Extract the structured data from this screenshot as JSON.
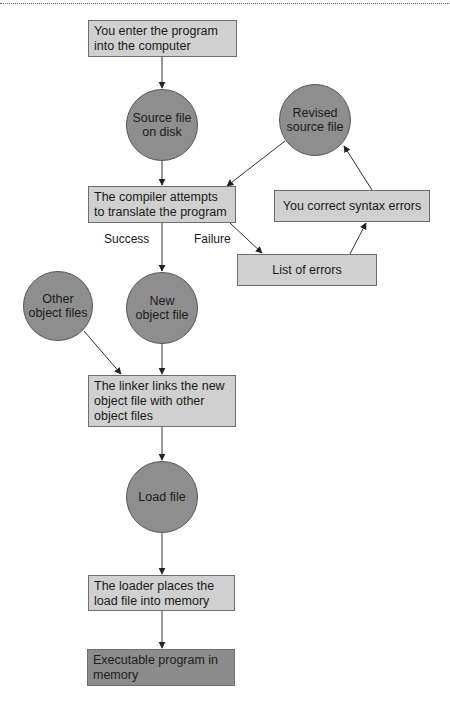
{
  "diagram": {
    "type": "flowchart",
    "nodes": {
      "enter_program": {
        "shape": "box",
        "text": "You enter the program into the computer"
      },
      "source_file": {
        "shape": "circle",
        "text": "Source file on disk"
      },
      "revised_source": {
        "shape": "circle",
        "text": "Revised source file"
      },
      "compiler": {
        "shape": "box",
        "text": "The compiler attempts to translate the program"
      },
      "correct_errors": {
        "shape": "box",
        "text": "You correct syntax errors"
      },
      "list_errors": {
        "shape": "box",
        "text": "List of errors"
      },
      "other_object": {
        "shape": "circle",
        "text": "Other object files"
      },
      "new_object": {
        "shape": "circle",
        "text": "New object file"
      },
      "linker": {
        "shape": "box",
        "text": "The linker links the new object file with other object files"
      },
      "load_file": {
        "shape": "circle",
        "text": "Load file"
      },
      "loader": {
        "shape": "box",
        "text": "The loader places the load file into memory"
      },
      "executable": {
        "shape": "box",
        "style": "dark",
        "text": "Executable program in memory"
      }
    },
    "edge_labels": {
      "success": "Success",
      "failure": "Failure"
    },
    "edges": [
      {
        "from": "enter_program",
        "to": "source_file"
      },
      {
        "from": "source_file",
        "to": "compiler"
      },
      {
        "from": "revised_source",
        "to": "compiler"
      },
      {
        "from": "compiler",
        "to": "new_object",
        "label": "Success"
      },
      {
        "from": "compiler",
        "to": "list_errors",
        "label": "Failure"
      },
      {
        "from": "list_errors",
        "to": "correct_errors"
      },
      {
        "from": "correct_errors",
        "to": "revised_source"
      },
      {
        "from": "other_object",
        "to": "linker"
      },
      {
        "from": "new_object",
        "to": "linker"
      },
      {
        "from": "linker",
        "to": "load_file"
      },
      {
        "from": "load_file",
        "to": "loader"
      },
      {
        "from": "loader",
        "to": "executable"
      }
    ],
    "colors": {
      "box_fill": "#d0d0d0",
      "circle_fill": "#8e8e8e",
      "dark_box_fill": "#8c8c8c",
      "stroke": "#333333"
    }
  }
}
